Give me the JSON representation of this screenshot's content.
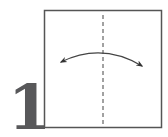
{
  "step": {
    "number": "1"
  },
  "diagram": {
    "paper": {
      "x": 44.5,
      "y": 10.5,
      "width": 117,
      "height": 117,
      "stroke": "#555555",
      "fill": "#ffffff"
    },
    "valley_fold_line": {
      "x": 103,
      "y1": 15,
      "y2": 127,
      "stroke": "#444444",
      "dash": "4,3",
      "style": "dashed"
    },
    "fold_unfold_arrow": {
      "from": [
        61,
        62
      ],
      "to": [
        142,
        66
      ],
      "control": [
        102,
        42
      ],
      "stroke": "#444444",
      "meaning": "fold-and-unfold"
    }
  },
  "colors": {
    "text": "#58585a",
    "line": "#444444",
    "background": "#ffffff"
  }
}
